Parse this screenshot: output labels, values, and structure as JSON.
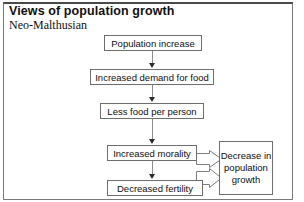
{
  "figure": {
    "title": "Views of population growth",
    "subtitle": "Neo-Malthusian",
    "frame_border_color": "#7a7a7a",
    "background_color": "#ffffff",
    "text_color": "#0f0f0f"
  },
  "diagram_data": {
    "type": "flowchart",
    "orientation": "vertical-with-side-branch",
    "nodes": [
      {
        "id": "population-increase",
        "label": "Population increase"
      },
      {
        "id": "increased-demand",
        "label": "Increased demand for food"
      },
      {
        "id": "less-food",
        "label": "Less food per person"
      },
      {
        "id": "increased-morality",
        "label": "Increased morality"
      },
      {
        "id": "decreased-fertility",
        "label": "Decreased fertility"
      },
      {
        "id": "decrease-population",
        "label": "Decrease in population growth"
      }
    ],
    "edges": [
      {
        "from": "population-increase",
        "to": "increased-demand",
        "style": "thin-arrow-down"
      },
      {
        "from": "increased-demand",
        "to": "less-food",
        "style": "thin-arrow-down"
      },
      {
        "from": "less-food",
        "to": "increased-morality",
        "style": "thin-arrow-down"
      },
      {
        "from": "increased-morality",
        "to": "decreased-fertility",
        "style": "thin-arrow-down"
      },
      {
        "from": "increased-morality",
        "to": "decrease-population",
        "style": "hollow-block-arrow-right"
      },
      {
        "from": "decreased-fertility",
        "to": "decrease-population",
        "style": "hollow-block-arrow-right"
      }
    ],
    "icons": {
      "arrowhead": "arrow-down-icon",
      "block_arrow": "block-arrow-right-icon"
    }
  }
}
